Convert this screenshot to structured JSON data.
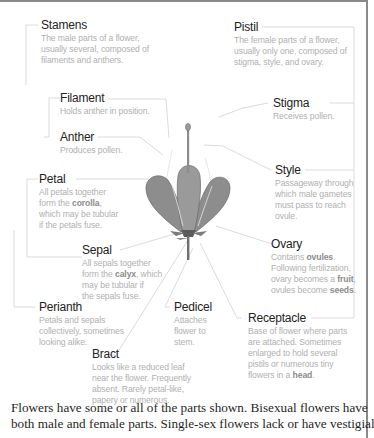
{
  "diagram": {
    "title": "Parts of a flower",
    "colors": {
      "flower_fill": "#8d8d8d",
      "flower_outline": "#6a6a6a",
      "leader_line": "#cfcfcf",
      "title_text": "#222222",
      "desc_text": "#b0b0b0",
      "frame_rule": "#8a8a8a"
    },
    "labels": {
      "stamens": {
        "title": "Stamens",
        "desc": [
          "The male parts of a flower,",
          "usually several, composed of",
          "filaments and anthers."
        ]
      },
      "filament": {
        "title": "Filament",
        "desc": [
          "Holds anther in position."
        ]
      },
      "anther": {
        "title": "Anther",
        "desc": [
          "Produces pollen."
        ]
      },
      "petal": {
        "title": "Petal",
        "desc_pre": "All petals together",
        "desc_mid_pre": "form the ",
        "desc_bold": "corolla",
        "desc_mid_post": ",",
        "desc_post": [
          "which may be tubular",
          "if the petals fuse."
        ]
      },
      "sepal": {
        "title": "Sepal",
        "desc_pre": "All sepals together",
        "desc_mid_pre": "form the ",
        "desc_bold": "calyx",
        "desc_mid_post": ", which",
        "desc_post": [
          "may be tubular if",
          "the sepals fuse."
        ]
      },
      "perianth": {
        "title": "Perianth",
        "desc": [
          "Petals and sepals",
          "collectively, sometimes",
          "looking alike."
        ]
      },
      "bract": {
        "title": "Bract",
        "desc": [
          "Looks like a reduced leaf",
          "near the flower. Frequently",
          "absent. Rarely petal-like,",
          "papery or numerous."
        ]
      },
      "pedicel": {
        "title": "Pedicel",
        "desc": [
          "Attaches",
          "flower to",
          "stem."
        ]
      },
      "pistil": {
        "title": "Pistil",
        "desc": [
          "The female parts of a flower,",
          "usually only one, composed of",
          "stigma, style, and ovary."
        ]
      },
      "stigma": {
        "title": "Stigma",
        "desc": [
          "Receives pollen."
        ]
      },
      "style": {
        "title": "Style",
        "desc": [
          "Passageway through",
          "which male gametes",
          "must pass to reach",
          "ovule."
        ]
      },
      "ovary": {
        "title": "Ovary",
        "line1_pre": "Contains ",
        "line1_bold": "ovules",
        "line1_post": ".",
        "line2": "Following fertilization,",
        "line3_pre": "ovary becomes a ",
        "line3_bold": "fruit",
        "line3_post": ",",
        "line4_pre": "ovules become ",
        "line4_bold": "seeds",
        "line4_post": "."
      },
      "receptacle": {
        "title": "Receptacle",
        "desc_lines": [
          "Base of flower where parts",
          "are attached.  Sometimes",
          "enlarged to hold several",
          "pistils or numerous tiny"
        ],
        "last_pre": "flowers in a ",
        "last_bold": "head",
        "last_post": "."
      }
    },
    "caption": [
      "Flowers have some or all of the parts shown. Bisexual flowers have",
      "both male and female parts. Single-sex flowers lack or have vestigial"
    ]
  }
}
